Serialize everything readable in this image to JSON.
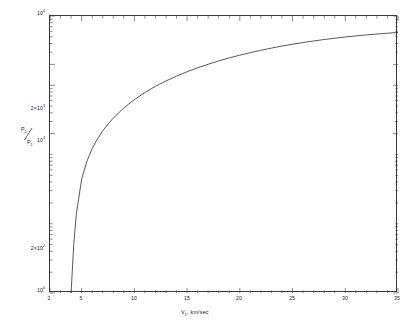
{
  "figure": {
    "background_color": "#ffffff",
    "line_color": "#3a3a3a",
    "axis_color": "#3a3a3a"
  },
  "axes": {
    "x": {
      "title_main": "V",
      "title_sub": "1",
      "title_rest": ", km/sec",
      "min": 2,
      "max": 35,
      "scale": "linear",
      "tick_labels": [
        "2",
        "5",
        "10",
        "15",
        "20",
        "25",
        "30",
        "35"
      ],
      "tick_values": [
        2,
        5,
        10,
        15,
        20,
        25,
        30,
        35
      ],
      "minor_step": 1
    },
    "y": {
      "title_num": "P",
      "title_num_sub": "2",
      "title_den": "P",
      "title_den_sub": "1",
      "min": 1,
      "max": 10000,
      "scale": "log",
      "tick_labels": [
        {
          "mantissa": "10",
          "exponent": "0",
          "value": 1
        },
        {
          "mantissa": "2×10",
          "exponent": "2",
          "value": 200
        },
        {
          "mantissa": "10",
          "exponent": "3",
          "value": 1000
        },
        {
          "mantissa": "2×10",
          "exponent": "3",
          "value": 2000
        },
        {
          "mantissa": "10",
          "exponent": "4",
          "value": 10000
        }
      ]
    }
  },
  "chart_data": {
    "type": "line",
    "title": "",
    "subtitle": "",
    "xlabel": "V1, km/sec",
    "ylabel": "P2/P1",
    "xlim": [
      2,
      35
    ],
    "ylim": [
      1,
      10000
    ],
    "yscale": "log",
    "xscale": "linear",
    "grid": false,
    "legend": null,
    "annotations": [],
    "x_tick_labels": [
      "2",
      "5",
      "10",
      "15",
      "20",
      "25",
      "30",
      "35"
    ],
    "y_tick_labels": [
      "10^0",
      "2x10^2",
      "10^3",
      "2x10^3",
      "10^4"
    ],
    "series": [
      {
        "name": "P2/P1 vs V1",
        "x": [
          4.0,
          4.25,
          4.5,
          5.0,
          5.5,
          6.0,
          6.5,
          7.0,
          7.5,
          8.0,
          9.0,
          10.0,
          11.0,
          12.0,
          13.0,
          14.0,
          15.0,
          16.0,
          17.0,
          18.0,
          19.0,
          20.0,
          21.0,
          22.0,
          23.0,
          24.0,
          25.0,
          26.0,
          27.0,
          28.0,
          29.0,
          30.0,
          31.0,
          32.0,
          33.0,
          34.0,
          35.0
        ],
        "y": [
          1.0,
          5.0,
          14.0,
          44.0,
          80.0,
          122.0,
          168.0,
          220.0,
          276.0,
          336.0,
          470.0,
          620.0,
          785.0,
          965.0,
          1155.0,
          1355.0,
          1565.0,
          1785.0,
          2010.0,
          2245.0,
          2480.0,
          2720.0,
          2960.0,
          3200.0,
          3440.0,
          3680.0,
          3915.0,
          4140.0,
          4360.0,
          4575.0,
          4780.0,
          4975.0,
          5160.0,
          5330.0,
          5490.0,
          5640.0,
          5780.0
        ]
      }
    ]
  }
}
